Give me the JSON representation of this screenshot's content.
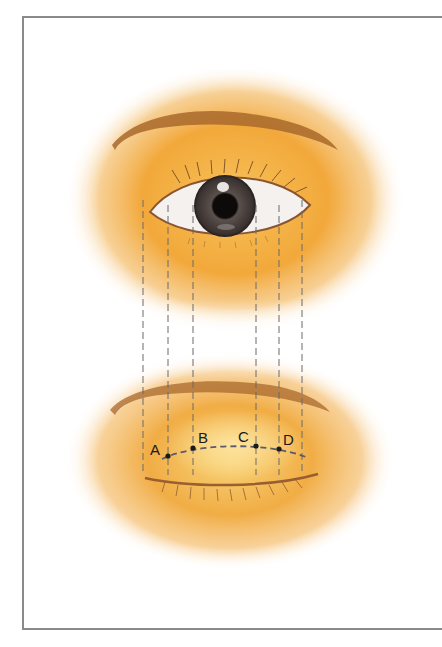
{
  "figure": {
    "colors": {
      "skin": "#f2a83a",
      "skin_light": "#fbd98a",
      "brow": "#a8682c",
      "iris": "#3b3331",
      "guide_line": "#6a6a6a",
      "frame": "#8a8a8a"
    },
    "guide_lines_x": [
      143,
      168,
      193,
      256,
      279,
      302
    ],
    "points": [
      {
        "label": "A",
        "x": 168,
        "y": 456
      },
      {
        "label": "B",
        "x": 193,
        "y": 448
      },
      {
        "label": "C",
        "x": 256,
        "y": 446
      },
      {
        "label": "D",
        "x": 279,
        "y": 449
      }
    ]
  }
}
